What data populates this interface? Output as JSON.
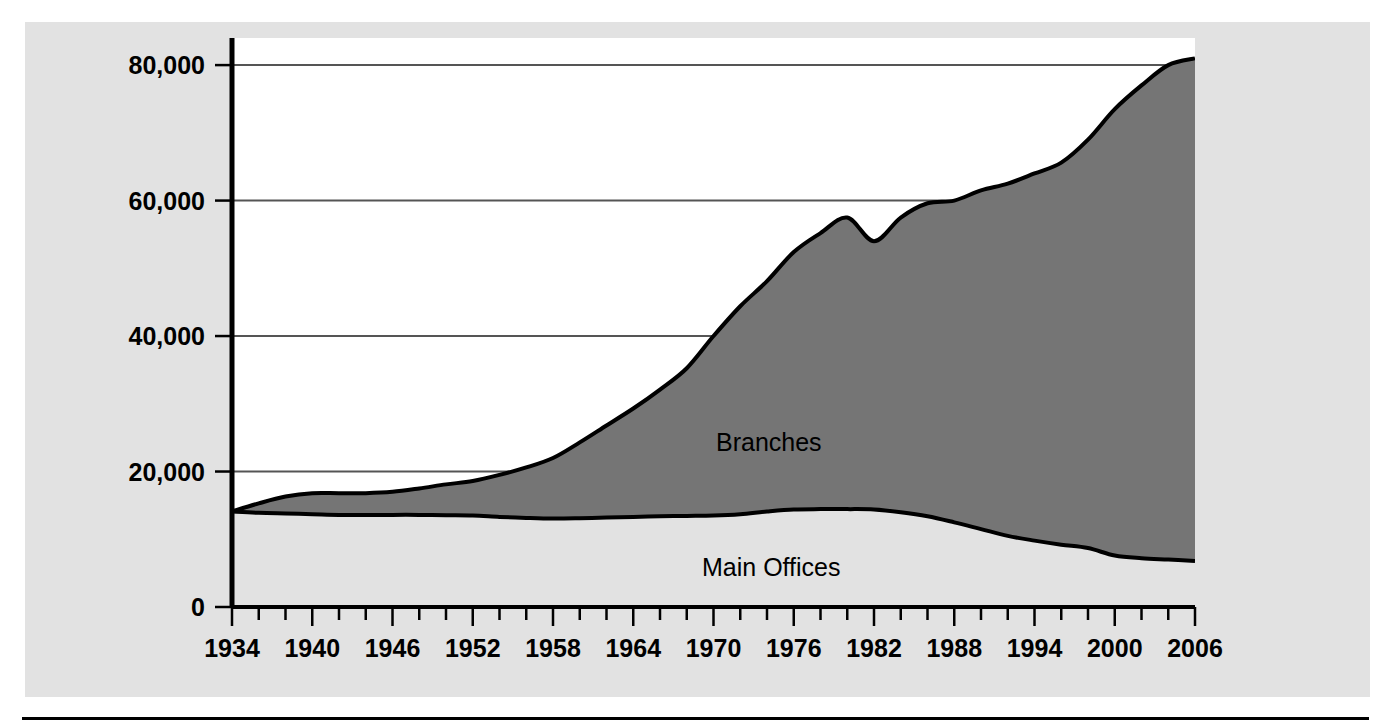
{
  "figure": {
    "background_color": "#e2e2e2",
    "plot_background_color": "#ffffff",
    "series_fill_color": "#757575",
    "line_color": "#000000",
    "gridline_color": "#555555",
    "bottom_rule_color": "#000000"
  },
  "labels": {
    "branches": "Branches",
    "main_offices": "Main Offices"
  },
  "chart_data": {
    "type": "area",
    "stacked": true,
    "title": "",
    "xlabel": "",
    "ylabel": "",
    "xlim": [
      1934,
      2006
    ],
    "ylim": [
      0,
      84000
    ],
    "grid": true,
    "gridlines_y": [
      20000,
      40000,
      60000,
      80000
    ],
    "legend_position": "inline-annotation",
    "y_tick_labels": [
      "0",
      "20,000",
      "40,000",
      "60,000",
      "80,000"
    ],
    "y_ticks": [
      0,
      20000,
      40000,
      60000,
      80000
    ],
    "x_tick_labels": [
      "1934",
      "1940",
      "1946",
      "1952",
      "1958",
      "1964",
      "1970",
      "1976",
      "1982",
      "1988",
      "1994",
      "2000",
      "2006"
    ],
    "x_ticks_major": [
      1934,
      1940,
      1946,
      1952,
      1958,
      1964,
      1970,
      1976,
      1982,
      1988,
      1994,
      2000,
      2006
    ],
    "x_ticks_minor_interval": 2,
    "x": [
      1934,
      1936,
      1938,
      1940,
      1942,
      1944,
      1946,
      1948,
      1950,
      1952,
      1954,
      1956,
      1958,
      1960,
      1962,
      1964,
      1966,
      1968,
      1970,
      1972,
      1974,
      1976,
      1978,
      1980,
      1982,
      1984,
      1986,
      1988,
      1990,
      1992,
      1994,
      1996,
      1998,
      2000,
      2002,
      2004,
      2006
    ],
    "series": [
      {
        "name": "Main Offices",
        "values": [
          14100,
          13900,
          13800,
          13700,
          13600,
          13600,
          13600,
          13600,
          13550,
          13500,
          13300,
          13150,
          13050,
          13100,
          13200,
          13300,
          13400,
          13450,
          13500,
          13700,
          14100,
          14400,
          14450,
          14450,
          14400,
          14000,
          13400,
          12500,
          11500,
          10500,
          9800,
          9200,
          8700,
          7600,
          7200,
          7000,
          6800
        ]
      },
      {
        "name": "Branches",
        "values": [
          0,
          1400,
          2500,
          3100,
          3200,
          3200,
          3400,
          3900,
          4550,
          5100,
          6200,
          7450,
          8950,
          11200,
          13600,
          16000,
          18700,
          21800,
          26500,
          30700,
          34000,
          38000,
          40750,
          43050,
          39600,
          43500,
          46200,
          47500,
          50000,
          52000,
          54200,
          56400,
          60300,
          65900,
          69800,
          73000,
          74200
        ]
      }
    ],
    "series_totals": {
      "name": "Total Offices",
      "values": [
        14100,
        15300,
        16300,
        16800,
        16800,
        16800,
        17000,
        17500,
        18100,
        18600,
        19500,
        20600,
        22000,
        24300,
        26800,
        29300,
        32100,
        35250,
        40000,
        44400,
        48100,
        52400,
        55200,
        57500,
        54000,
        57500,
        59600,
        60000,
        61500,
        62500,
        64000,
        65600,
        69000,
        73500,
        77000,
        80000,
        81000
      ]
    }
  }
}
